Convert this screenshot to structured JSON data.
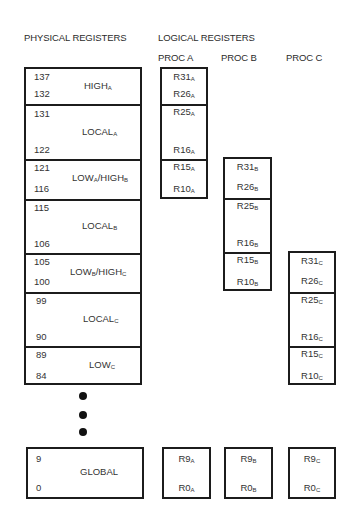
{
  "headers": {
    "physical": "PHYSICAL REGISTERS",
    "logical": "LOGICAL REGISTERS",
    "proc_a": "PROC A",
    "proc_b": "PROC B",
    "proc_c": "PROC C"
  },
  "physical": {
    "segments": [
      {
        "top_num": "137",
        "bottom_num": "132",
        "name": "HIGH",
        "sub": "A",
        "name2": "",
        "sub2": ""
      },
      {
        "top_num": "131",
        "bottom_num": "122",
        "name": "LOCAL",
        "sub": "A",
        "name2": "",
        "sub2": ""
      },
      {
        "top_num": "121",
        "bottom_num": "116",
        "name": "LOW",
        "sub": "A",
        "name2": "/HIGH",
        "sub2": "B"
      },
      {
        "top_num": "115",
        "bottom_num": "106",
        "name": "LOCAL",
        "sub": "B",
        "name2": "",
        "sub2": ""
      },
      {
        "top_num": "105",
        "bottom_num": "100",
        "name": "LOW",
        "sub": "B",
        "name2": "/HIGH",
        "sub2": "C"
      },
      {
        "top_num": "99",
        "bottom_num": "90",
        "name": "LOCAL",
        "sub": "C",
        "name2": "",
        "sub2": ""
      },
      {
        "top_num": "89",
        "bottom_num": "84",
        "name": "LOW",
        "sub": "C",
        "name2": "",
        "sub2": ""
      }
    ],
    "global": {
      "top_num": "9",
      "bottom_num": "0",
      "name": "GLOBAL"
    }
  },
  "logical": {
    "proc_a": {
      "segments": [
        {
          "top": "R31",
          "bottom": "R26",
          "sub": "A"
        },
        {
          "top": "R25",
          "bottom": "R16",
          "sub": "A"
        },
        {
          "top": "R15",
          "bottom": "R10",
          "sub": "A"
        }
      ],
      "global": {
        "top": "R9",
        "bottom": "R0",
        "sub": "A"
      }
    },
    "proc_b": {
      "segments": [
        {
          "top": "R31",
          "bottom": "R26",
          "sub": "B"
        },
        {
          "top": "R25",
          "bottom": "R16",
          "sub": "B"
        },
        {
          "top": "R15",
          "bottom": "R10",
          "sub": "B"
        }
      ],
      "global": {
        "top": "R9",
        "bottom": "R0",
        "sub": "B"
      }
    },
    "proc_c": {
      "segments": [
        {
          "top": "R31",
          "bottom": "R26",
          "sub": "C"
        },
        {
          "top": "R25",
          "bottom": "R16",
          "sub": "C"
        },
        {
          "top": "R15",
          "bottom": "R10",
          "sub": "C"
        }
      ],
      "global": {
        "top": "R9",
        "bottom": "R0",
        "sub": "C"
      }
    }
  },
  "ellipsis": {
    "dot_count": 3
  }
}
